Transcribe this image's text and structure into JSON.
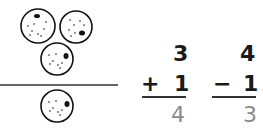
{
  "illustration": {
    "top_count": 3,
    "bottom_count": 1,
    "description": "three cookies above line, one cookie below"
  },
  "problems": [
    {
      "top": "3",
      "operator": "+",
      "operand": "1",
      "answer": "4"
    },
    {
      "top": "4",
      "operator": "−",
      "operand": "1",
      "answer": "3"
    }
  ],
  "colors": {
    "ink": "#1a1a1a",
    "answer": "#8a8a8a"
  }
}
